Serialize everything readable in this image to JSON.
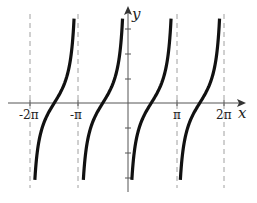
{
  "chart_data": {
    "type": "line",
    "title": "",
    "function": "y = -cot(x)",
    "xlabel": "x",
    "ylabel": "y",
    "xlim": [
      -7.0,
      7.5
    ],
    "ylim": [
      -3.5,
      3.7
    ],
    "x_ticks": [
      {
        "value": -6.2832,
        "label": "-2π"
      },
      {
        "value": -3.1416,
        "label": "-π"
      },
      {
        "value": 3.1416,
        "label": "π"
      },
      {
        "value": 6.2832,
        "label": "2π"
      }
    ],
    "y_ticks": [
      -3,
      -2,
      -1,
      1,
      2,
      3
    ],
    "asymptotes": [
      {
        "x": -6.2832,
        "label": "-2π",
        "style": "dashed"
      },
      {
        "x": -3.1416,
        "label": "-π",
        "style": "dashed"
      },
      {
        "x": 0,
        "label": "0",
        "style": "y-axis"
      },
      {
        "x": 3.1416,
        "label": "π",
        "style": "dashed"
      },
      {
        "x": 6.2832,
        "label": "2π",
        "style": "dashed"
      }
    ],
    "series": [
      {
        "name": "branch-1",
        "x_range": [
          -6.2832,
          -3.1416
        ],
        "zero_at": -4.7124
      },
      {
        "name": "branch-2",
        "x_range": [
          -3.1416,
          0
        ],
        "zero_at": -1.5708
      },
      {
        "name": "branch-3",
        "x_range": [
          0,
          3.1416
        ],
        "zero_at": 1.5708
      },
      {
        "name": "branch-4",
        "x_range": [
          3.1416,
          6.2832
        ],
        "zero_at": 4.7124
      }
    ],
    "grid": false,
    "legend": null,
    "colors": {
      "curve": "#111111",
      "axis": "#555555",
      "asymptote": "#999999"
    }
  },
  "labels": {
    "x_axis": "x",
    "y_axis": "y",
    "tick_neg_2pi": "-2π",
    "tick_neg_pi": "-π",
    "tick_pi": "π",
    "tick_2pi": "2π"
  }
}
